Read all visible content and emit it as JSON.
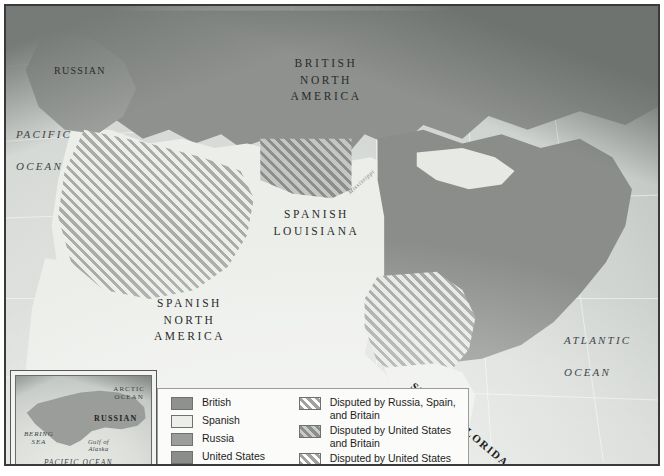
{
  "map": {
    "title": "North America territorial claims map",
    "regions": [
      {
        "name": "RUSSIAN",
        "style": "russian"
      },
      {
        "name": "BRITISH\nNORTH\nAMERICA",
        "style": "country"
      },
      {
        "name": "SPANISH\nLOUISIANA",
        "style": "country"
      },
      {
        "name": "SPANISH\nNORTH\nAMERICA",
        "style": "country"
      },
      {
        "name": "SPANISH FLORIDA",
        "style": "florida"
      }
    ],
    "labels": {
      "russian": "RUSSIAN",
      "british_north_america": "BRITISH\nNORTH\nAMERICA",
      "spanish_louisiana": "SPANISH\nLOUISIANA",
      "spanish_north_america": "SPANISH\nNORTH\nAMERICA",
      "spanish_florida": "SPANISH FLORIDA",
      "pacific_ocean": "PACIFIC\n\nOCEAN",
      "atlantic_ocean": "ATLANTIC\n\nOCEAN",
      "gulf_of_mexico": "GULF\nOF\nMEXICO",
      "mississippi": "Mississippi"
    },
    "colors": {
      "british": "#8e918d",
      "spanish": "#eceeea",
      "russia": "#9a9d99",
      "united_states": "#8a8d89",
      "ocean": "#d9dcd8",
      "frame": "#3a3a3a"
    }
  },
  "inset": {
    "title": "Alaska detail inset",
    "labels": {
      "arctic_ocean": "ARCTIC\nOCEAN",
      "russian": "RUSSIAN",
      "bering_sea": "BERING\nSEA",
      "gulf_of_alaska": "Gulf of\nAlaska",
      "pacific_ocean": "PACIFIC  OCEAN"
    }
  },
  "legend": {
    "solid_items": [
      {
        "label": "British",
        "swatch": "british"
      },
      {
        "label": "Spanish",
        "swatch": "spanish"
      },
      {
        "label": "Russia",
        "swatch": "russia"
      },
      {
        "label": "United States",
        "swatch": "united-states"
      }
    ],
    "hatched_items": [
      {
        "label": "Disputed by Russia, Spain,\nand Britain",
        "swatch": "hatch-russia-spain-britain"
      },
      {
        "label": "Disputed by United States\nand Britain",
        "swatch": "hatch-us-britain"
      },
      {
        "label": "Disputed by United States\nand Spain",
        "swatch": "hatch-us-spain"
      }
    ]
  }
}
